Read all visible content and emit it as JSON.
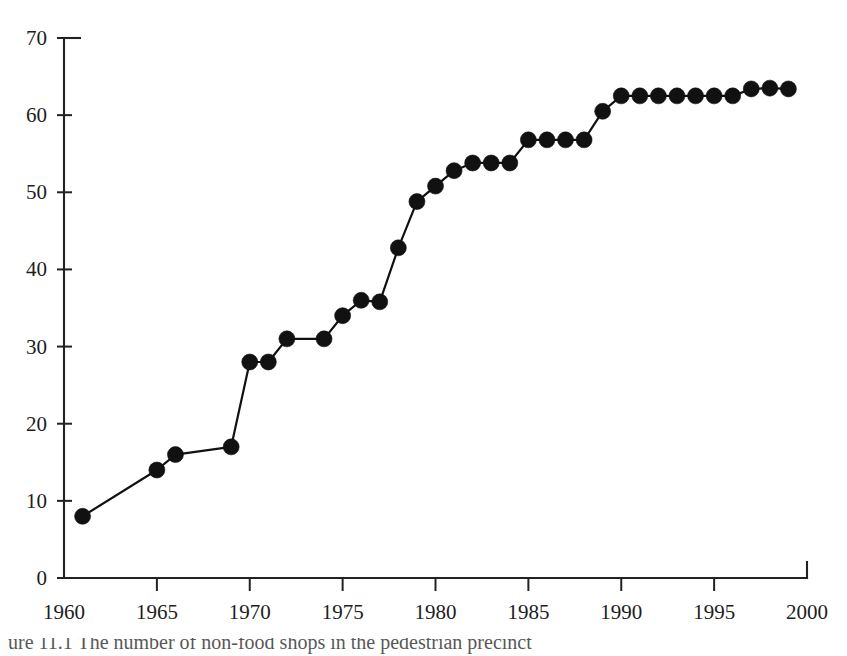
{
  "figure": {
    "background_color": "#ffffff",
    "ink_color": "#111111",
    "caption_partial": "ure 11.1  The number of non-food shops in the pedestrian precinct"
  },
  "chart_data": {
    "type": "line",
    "title": "",
    "subtitle": "",
    "xlabel": "",
    "ylabel": "",
    "xlim": [
      1960,
      2000
    ],
    "ylim": [
      0,
      70
    ],
    "grid": false,
    "legend": null,
    "annotations": [],
    "marker": "filled-circle",
    "line_color": "#111111",
    "marker_color": "#111111",
    "x_tick_labels": [
      "1960",
      "1965",
      "1970",
      "1975",
      "1980",
      "1985",
      "1990",
      "1995",
      "2000"
    ],
    "x_ticks": [
      1960,
      1965,
      1970,
      1975,
      1980,
      1985,
      1990,
      1995,
      2000
    ],
    "y_tick_labels": [
      "0",
      "10",
      "20",
      "30",
      "40",
      "50",
      "60",
      "70"
    ],
    "y_ticks": [
      0,
      10,
      20,
      30,
      40,
      50,
      60,
      70
    ],
    "x": [
      1961,
      1965,
      1966,
      1969,
      1970,
      1971,
      1972,
      1974,
      1975,
      1976,
      1977,
      1978,
      1979,
      1980,
      1981,
      1982,
      1983,
      1984,
      1985,
      1986,
      1987,
      1988,
      1989,
      1990,
      1991,
      1992,
      1993,
      1994,
      1995,
      1996,
      1997,
      1998,
      1999
    ],
    "values": [
      8.0,
      14.0,
      16.0,
      17.0,
      28.0,
      28.0,
      31.0,
      31.0,
      34.0,
      36.0,
      35.8,
      42.8,
      48.8,
      50.8,
      52.8,
      53.8,
      53.8,
      53.8,
      56.8,
      56.8,
      56.8,
      56.8,
      60.5,
      62.5,
      62.5,
      62.5,
      62.5,
      62.5,
      62.5,
      62.5,
      63.4,
      63.5,
      63.4
    ],
    "series": [
      {
        "name": "count",
        "values": [
          8.0,
          14.0,
          16.0,
          17.0,
          28.0,
          28.0,
          31.0,
          31.0,
          34.0,
          36.0,
          35.8,
          42.8,
          48.8,
          50.8,
          52.8,
          53.8,
          53.8,
          53.8,
          56.8,
          56.8,
          56.8,
          56.8,
          60.5,
          62.5,
          62.5,
          62.5,
          62.5,
          62.5,
          62.5,
          62.5,
          63.4,
          63.5,
          63.4
        ]
      }
    ]
  }
}
